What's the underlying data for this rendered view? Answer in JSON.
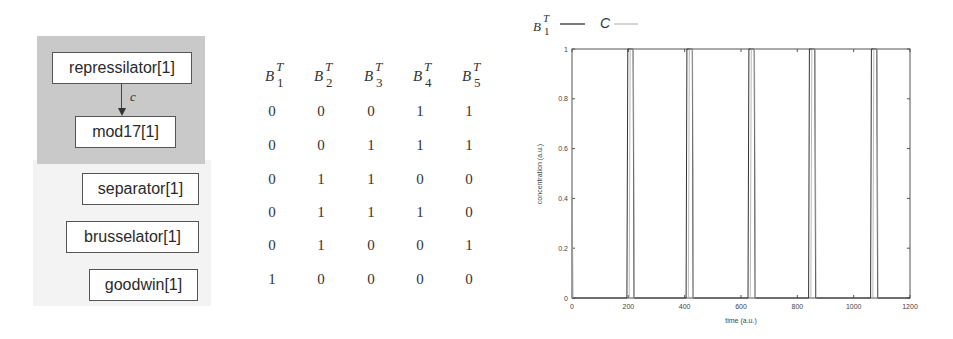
{
  "diagram": {
    "region_label": "",
    "nodes": [
      {
        "id": "repressilator",
        "label": "repressilator[1]"
      },
      {
        "id": "mod17",
        "label": "mod17[1]"
      },
      {
        "id": "separator",
        "label": "separator[1]"
      },
      {
        "id": "brusselator",
        "label": "brusselator[1]"
      },
      {
        "id": "goodwin",
        "label": "goodwin[1]"
      }
    ],
    "edges": [
      {
        "from": "repressilator",
        "to": "mod17",
        "label": "c"
      }
    ]
  },
  "table": {
    "headers": [
      {
        "base": "B",
        "sup": "T",
        "sub": "1"
      },
      {
        "base": "B",
        "sup": "T",
        "sub": "2"
      },
      {
        "base": "B",
        "sup": "T",
        "sub": "3"
      },
      {
        "base": "B",
        "sup": "T",
        "sub": "4"
      },
      {
        "base": "B",
        "sup": "T",
        "sub": "5"
      }
    ],
    "rows": [
      [
        "0",
        "0",
        "0",
        "1",
        "1"
      ],
      [
        "0",
        "0",
        "1",
        "1",
        "1"
      ],
      [
        "0",
        "1",
        "1",
        "0",
        "0"
      ],
      [
        "0",
        "1",
        "1",
        "1",
        "0"
      ],
      [
        "0",
        "1",
        "0",
        "0",
        "1"
      ],
      [
        "1",
        "0",
        "0",
        "0",
        "0"
      ]
    ]
  },
  "chart_data": {
    "type": "line",
    "title": "",
    "xlabel": "time (a.u.)",
    "ylabel": "concentration (a.u.)",
    "xlim": [
      0,
      1200
    ],
    "ylim": [
      0,
      1
    ],
    "xticks": [
      "0",
      "200",
      "400",
      "600",
      "800",
      "1000",
      "1200"
    ],
    "yticks": [
      "0",
      "0.2",
      "0.4",
      "0.6",
      "0.8",
      "1"
    ],
    "grid": false,
    "legend": {
      "position": "top-left, above plot",
      "entries": [
        {
          "label": "B_1^T",
          "style": "solid dark"
        },
        {
          "label": "C",
          "style": "solid light"
        }
      ]
    },
    "series": [
      {
        "name": "B_1^T",
        "description": "square pulses from 0 to 1",
        "pulses": [
          [
            195,
            220
          ],
          [
            405,
            430
          ],
          [
            625,
            650
          ],
          [
            840,
            865
          ],
          [
            1060,
            1085
          ]
        ],
        "x": [
          0,
          195,
          198,
          217,
          220,
          405,
          408,
          427,
          430,
          625,
          628,
          647,
          650,
          840,
          843,
          862,
          865,
          1060,
          1063,
          1082,
          1085,
          1200
        ],
        "y": [
          0,
          0,
          1,
          1,
          0,
          0,
          1,
          1,
          0,
          0,
          1,
          1,
          0,
          0,
          1,
          1,
          0,
          0,
          1,
          1,
          0,
          0
        ]
      },
      {
        "name": "C",
        "description": "initial transient at t=0 rising to ~0.4, then follows pulses",
        "x": [
          0,
          0,
          2
        ],
        "y": [
          0,
          0.4,
          0
        ]
      }
    ]
  }
}
